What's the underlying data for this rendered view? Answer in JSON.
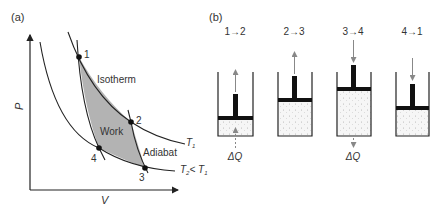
{
  "panel_a": {
    "label": "(a)",
    "y_axis_label": "P",
    "x_axis_label": "V",
    "points": [
      {
        "id": "1",
        "label": "1"
      },
      {
        "id": "2",
        "label": "2"
      },
      {
        "id": "3",
        "label": "3"
      },
      {
        "id": "4",
        "label": "4"
      }
    ],
    "isotherm_label": "Isotherm",
    "adiabat_label": "Adiabat",
    "work_label": "Work",
    "t1_label": "T",
    "t1_sub": "1",
    "t2_label": "T",
    "t2_sub": "2",
    "t2_cmp": "< T",
    "t2_cmp_sub": "1",
    "colors": {
      "work_fill": "#b3b3b3",
      "line": "#222222"
    }
  },
  "panel_b": {
    "label": "(b)",
    "steps": [
      {
        "label": "1→2",
        "heat": "ΔQ",
        "heat_dir": "in",
        "piston_motion": "up"
      },
      {
        "label": "2→3",
        "heat": "",
        "heat_dir": "none",
        "piston_motion": "up"
      },
      {
        "label": "3→4",
        "heat": "ΔQ",
        "heat_dir": "out",
        "piston_motion": "down"
      },
      {
        "label": "4→1",
        "heat": "",
        "heat_dir": "none",
        "piston_motion": "down"
      }
    ]
  }
}
